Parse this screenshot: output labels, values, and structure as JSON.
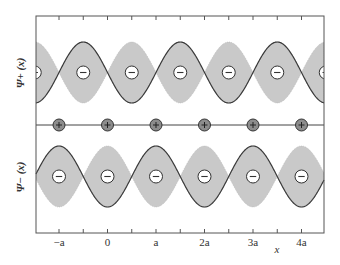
{
  "figure": {
    "type": "band-wavefunction-diagram",
    "panels": [
      {
        "id": "psi_plus",
        "ylabel": "Ψ+ (x)",
        "description": "cos-like wavefunction with nodes at ion positions, electron density maxima (minus charges) between ions"
      },
      {
        "id": "psi_minus",
        "ylabel": "Ψ− (x)",
        "description": "wavefunction with maxima at ion positions, nodes between ions"
      }
    ],
    "ions": {
      "label": "+",
      "positions_in_a": [
        -1,
        0,
        1,
        2,
        3,
        4
      ]
    },
    "electron_charge_label": "−",
    "xaxis": {
      "ticks": [
        "−a",
        "0",
        "a",
        "2a",
        "3a",
        "4a"
      ],
      "tick_values_in_a": [
        -1,
        0,
        1,
        2,
        3,
        4
      ],
      "minor_tick_values_in_a": [
        -0.5,
        0.5,
        1.5,
        2.5,
        3.5
      ],
      "label": "x"
    },
    "colors": {
      "fill": "#c9c9c9",
      "curve": "#3a3a3a",
      "ion_fill": "#8c8c8c",
      "frame": "#555555"
    }
  }
}
